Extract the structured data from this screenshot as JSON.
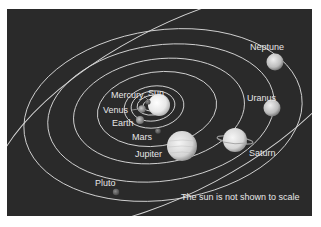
{
  "diagram": {
    "background_color": "#2a2a2a",
    "orbit_color": "#d8d8d8",
    "label_color": "#e6e6e6",
    "note": "The sun is not shown to scale",
    "labels": {
      "sun": "Sun",
      "mercury": "Mercury",
      "venus": "Venus",
      "earth": "Earth",
      "mars": "Mars",
      "jupiter": "Jupiter",
      "saturn": "Saturn",
      "uranus": "Uranus",
      "neptune": "Neptune",
      "pluto": "Pluto"
    },
    "bodies": [
      {
        "name": "Sun"
      },
      {
        "name": "Mercury"
      },
      {
        "name": "Venus"
      },
      {
        "name": "Earth"
      },
      {
        "name": "Mars"
      },
      {
        "name": "Jupiter"
      },
      {
        "name": "Saturn"
      },
      {
        "name": "Uranus"
      },
      {
        "name": "Neptune"
      },
      {
        "name": "Pluto"
      }
    ]
  }
}
